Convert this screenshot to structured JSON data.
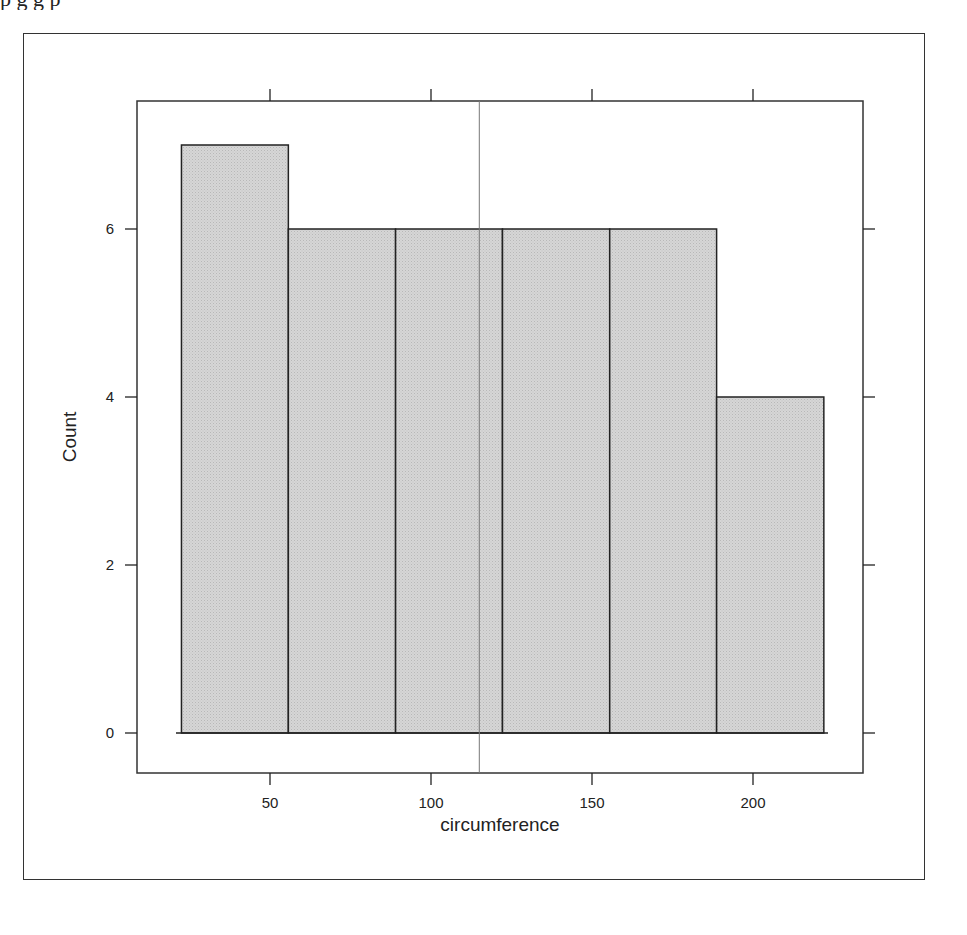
{
  "page": {
    "top_text_fragment": "p           g                                         g   p"
  },
  "chart_data": {
    "type": "bar",
    "subtype": "histogram",
    "title": "",
    "xlabel": "circumference",
    "ylabel": "Count",
    "bin_edges": [
      22.5,
      55.7,
      89.0,
      122.2,
      155.5,
      188.7,
      222.0
    ],
    "categories": [
      "22.5-55.7",
      "55.7-89.0",
      "89.0-122.2",
      "122.2-155.5",
      "155.5-188.7",
      "188.7-222.0"
    ],
    "values": [
      7,
      6,
      6,
      6,
      6,
      4
    ],
    "reference_line": {
      "orientation": "vertical",
      "x": 115,
      "color": "#777777"
    },
    "x_ticks": [
      50,
      100,
      150,
      200
    ],
    "y_ticks": [
      0,
      2,
      4,
      6
    ],
    "xlim": [
      3,
      230
    ],
    "ylim": [
      -0.5,
      7.5
    ],
    "grid": false,
    "legend": null,
    "bar_fill": "#d3d3d3",
    "bar_stroke": "#222222"
  }
}
